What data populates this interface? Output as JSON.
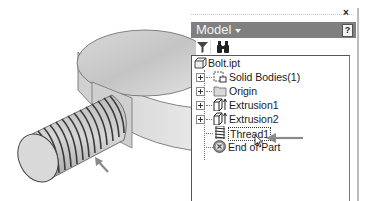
{
  "viewport": {
    "model_name": "threaded bolt",
    "arrow_annotation": "thread"
  },
  "panel": {
    "close_label": "×",
    "title": "Model",
    "help_label": "?",
    "toolbar": {
      "filter_icon": "filter-icon",
      "find_icon": "binoculars-icon"
    },
    "tree": {
      "root": {
        "label": "Bolt.ipt",
        "icon": "part-icon"
      },
      "items": [
        {
          "label": "Solid Bodies(1)",
          "icon": "solid-bodies-icon",
          "expandable": true
        },
        {
          "label": "Origin",
          "icon": "folder-icon",
          "expandable": true
        },
        {
          "label": "Extrusion1",
          "icon": "extrusion-icon",
          "expandable": true
        },
        {
          "label": "Extrusion2",
          "icon": "extrusion-icon",
          "expandable": true
        },
        {
          "label": "Thread1",
          "icon": "thread-icon",
          "expandable": false,
          "selected": true
        },
        {
          "label": "End of Part",
          "icon": "end-of-part-icon",
          "expandable": false
        }
      ]
    }
  },
  "colors": {
    "header_bg": "#7f7f7f",
    "annotation_arrow": "#8a8a8a"
  }
}
